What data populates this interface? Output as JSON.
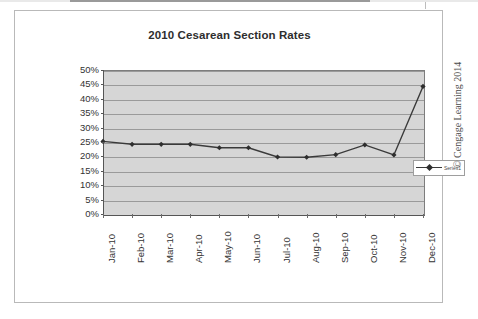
{
  "figure": {
    "title": "2010 Cesarean Section Rates",
    "credit": "© Cengage Learning 2014"
  },
  "chart_data": {
    "type": "line",
    "title": "2010 Cesarean Section Rates",
    "xlabel": "",
    "ylabel": "",
    "categories": [
      "Jan-10",
      "Feb-10",
      "Mar-10",
      "Apr-10",
      "May-10",
      "Jun-10",
      "Jul-10",
      "Aug-10",
      "Sep-10",
      "Oct-10",
      "Nov-10",
      "Dec-10"
    ],
    "series": [
      {
        "name": "Series1",
        "values": [
          25.2,
          24.2,
          24.2,
          24.2,
          23.0,
          23.0,
          19.8,
          19.7,
          20.6,
          24.0,
          20.5,
          44.3
        ]
      }
    ],
    "ylim": [
      0,
      50
    ],
    "ytick_labels": [
      "50%",
      "45%",
      "40%",
      "35%",
      "30%",
      "25%",
      "20%",
      "15%",
      "10%",
      "5%",
      "0%"
    ],
    "ytick_values": [
      50,
      45,
      40,
      35,
      30,
      25,
      20,
      15,
      10,
      5,
      0
    ],
    "ytick_step": 5,
    "y_unit": "%",
    "grid": true,
    "legend_position": "inside-right",
    "legend_entries": [
      "Series1"
    ],
    "plot_background": "#d6d6d6",
    "line_color": "#3a3a3a",
    "marker_color": "#2e2e2e",
    "marker_shape": "diamond"
  }
}
